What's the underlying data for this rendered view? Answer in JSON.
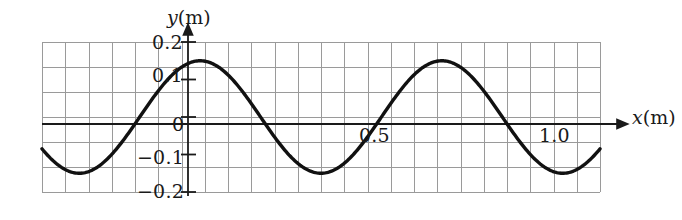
{
  "figure": {
    "title": "",
    "background_color": "#ffffff",
    "line_color": "#111111",
    "grid_color": "#9a9a9a",
    "axis_color": "#1a1a1a"
  },
  "axes": {
    "y_axis_title": "y",
    "y_axis_unit": "(m)",
    "x_axis_title": "x",
    "x_axis_unit": "(m)",
    "y_ticks": [
      {
        "label": "0.2",
        "value": 0.2
      },
      {
        "label": "0.1",
        "value": 0.1
      },
      {
        "label": "0",
        "value": 0
      },
      {
        "label": "−0.1",
        "value": -0.1
      },
      {
        "label": "−0.2",
        "value": -0.2
      }
    ],
    "x_ticks": [
      {
        "label": "0.5",
        "value": 0.5
      },
      {
        "label": "1.0",
        "value": 1.0
      }
    ]
  },
  "chart_data": {
    "type": "line",
    "title": "",
    "xlabel": "x (m)",
    "ylabel": "y (m)",
    "xlim": [
      -0.2425,
      1.1425
    ],
    "ylim": [
      -0.2,
      0.2
    ],
    "grid": true,
    "legend": null,
    "series": [
      {
        "name": "wave",
        "form": "y = 0.15 sin(2πx / 0.60)",
        "amplitude": 0.15,
        "wavelength": 0.6,
        "phase": 0,
        "x": [
          -0.24,
          -0.22,
          -0.2,
          -0.18,
          -0.16,
          -0.14,
          -0.12,
          -0.1,
          -0.08,
          -0.06,
          -0.04,
          -0.02,
          0.0,
          0.02,
          0.04,
          0.06,
          0.08,
          0.1,
          0.12,
          0.14,
          0.16,
          0.18,
          0.2,
          0.22,
          0.24,
          0.26,
          0.28,
          0.3,
          0.32,
          0.34,
          0.36,
          0.38,
          0.4,
          0.42,
          0.44,
          0.46,
          0.48,
          0.5,
          0.52,
          0.54,
          0.56,
          0.58,
          0.6,
          0.62,
          0.64,
          0.66,
          0.68,
          0.7,
          0.72,
          0.74,
          0.76,
          0.78,
          0.8,
          0.82,
          0.84,
          0.86,
          0.88,
          0.9,
          0.92,
          0.94,
          0.96,
          0.98,
          1.0,
          1.02,
          1.04,
          1.06,
          1.08,
          1.1,
          1.12,
          1.14
        ],
        "y": [
          -0.104,
          -0.127,
          -0.143,
          -0.15,
          -0.149,
          -0.139,
          -0.121,
          -0.097,
          -0.068,
          -0.035,
          -0.001,
          0.033,
          0.0,
          0.031,
          0.061,
          0.089,
          0.113,
          0.13,
          0.142,
          0.149,
          0.15,
          0.145,
          0.134,
          0.117,
          0.095,
          0.069,
          0.041,
          0.011,
          -0.02,
          -0.05,
          -0.078,
          -0.103,
          -0.123,
          -0.138,
          -0.148,
          -0.15,
          -0.146,
          -0.136,
          -0.12,
          -0.099,
          -0.074,
          -0.046,
          -0.017,
          0.014,
          0.044,
          0.073,
          0.099,
          0.12,
          0.136,
          0.147,
          0.15,
          0.147,
          0.137,
          0.122,
          0.101,
          0.076,
          0.049,
          0.02,
          -0.011,
          -0.041,
          -0.07,
          -0.096,
          -0.118,
          -0.134,
          -0.145,
          -0.15,
          -0.148,
          -0.14,
          -0.125,
          -0.106
        ],
        "key_points": {
          "troughs": [
            {
              "x": 0.15,
              "y": -0.15
            },
            {
              "x": 0.45,
              "y": -0.15
            },
            {
              "x": 1.05,
              "y": -0.15
            }
          ],
          "peaks": [
            {
              "x": 0.3,
              "y": 0.15
            },
            {
              "x": 0.9,
              "y": 0.15
            }
          ],
          "zero_crossings": [
            0.0,
            0.3,
            0.6,
            0.9
          ]
        }
      }
    ]
  }
}
